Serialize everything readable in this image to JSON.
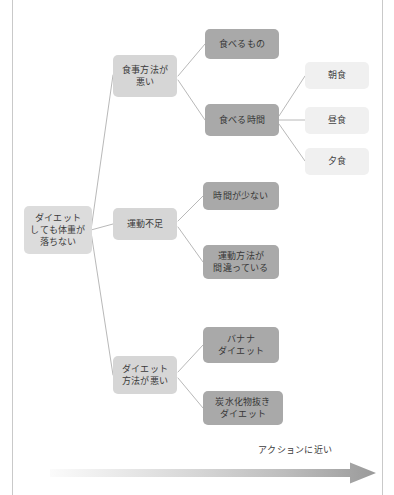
{
  "diagram": {
    "type": "logic-tree",
    "root": {
      "id": "root",
      "label": "ダイエット\nしても体重が\n落ちない"
    },
    "level2": [
      {
        "id": "meal-method",
        "label": "食事方法が\n悪い"
      },
      {
        "id": "lack-exercise",
        "label": "運動不足"
      },
      {
        "id": "diet-method",
        "label": "ダイエット\n方法が悪い"
      }
    ],
    "level3": [
      {
        "id": "what-to-eat",
        "label": "食べるもの",
        "parent": "meal-method"
      },
      {
        "id": "when-to-eat",
        "label": "食べる時間",
        "parent": "meal-method"
      },
      {
        "id": "little-time",
        "label": "時間が少ない",
        "parent": "lack-exercise"
      },
      {
        "id": "wrong-exercise",
        "label": "運動方法が\n間違っている",
        "parent": "lack-exercise"
      },
      {
        "id": "banana-diet",
        "label": "バナナ\nダイエット",
        "parent": "diet-method"
      },
      {
        "id": "no-carb-diet",
        "label": "炭水化物抜き\nダイエット",
        "parent": "diet-method"
      }
    ],
    "level4": [
      {
        "id": "breakfast",
        "label": "朝食",
        "parent": "when-to-eat"
      },
      {
        "id": "lunch",
        "label": "昼食",
        "parent": "when-to-eat"
      },
      {
        "id": "dinner",
        "label": "夕食",
        "parent": "when-to-eat"
      }
    ],
    "axis": {
      "caption": "アクションに近い",
      "direction": "left-to-right"
    },
    "colors": {
      "root_fill": "#dcdcdc",
      "level2_fill": "#d6d6d6",
      "level3_fill": "#a9a9a9",
      "level4_fill": "#f0f0f0",
      "connector": "#b0b0b0",
      "text": "#3a3a3a",
      "frame_rule": "#c9c9c9",
      "arrow_dark": "#9a9a9a",
      "arrow_light": "#f4f4f4"
    }
  }
}
